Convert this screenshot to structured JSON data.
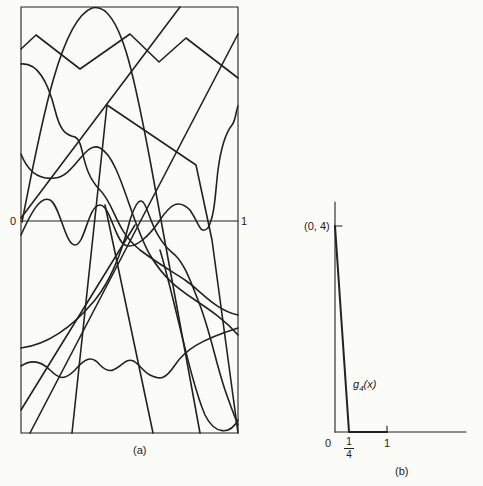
{
  "figure": {
    "panel_a": {
      "caption": "(a)",
      "axis_left_label": "0",
      "axis_right_label": "1",
      "description": "Many continuous functions on [0,1] drawn inside a rectangle with a horizontal zero axis"
    },
    "panel_b": {
      "caption": "(b)",
      "peak_label": "(0, 4)",
      "curve_label": "g4(x)",
      "curve_label_base": "g",
      "curve_label_sub": "4",
      "curve_label_arg": "(x)",
      "origin_label": "0",
      "quarter_num": "1",
      "quarter_den": "4",
      "one_label": "1"
    }
  },
  "colors": {
    "background": "#fbfbf7",
    "ink": "#222222"
  }
}
